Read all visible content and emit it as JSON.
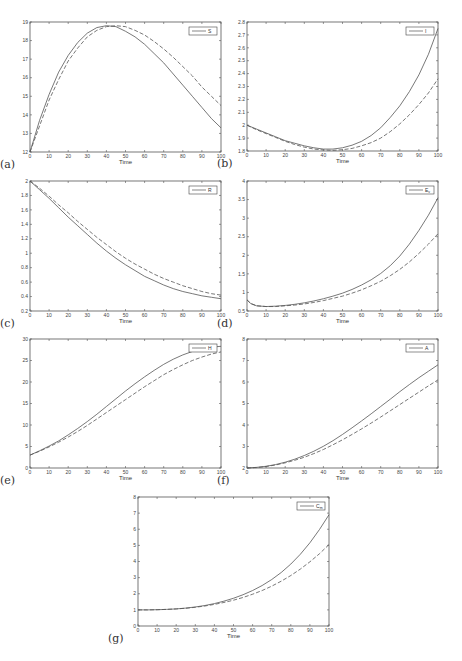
{
  "figure": {
    "panels": [
      {
        "id": "a",
        "label": "(a)",
        "legend": "S",
        "legend_sub": "",
        "xlabel": "Time"
      },
      {
        "id": "b",
        "label": "(b)",
        "legend": "I",
        "legend_sub": "",
        "xlabel": "Time"
      },
      {
        "id": "c",
        "label": "(c)",
        "legend": "R",
        "legend_sub": "",
        "xlabel": "Time"
      },
      {
        "id": "d",
        "label": "(d)",
        "legend": "E",
        "legend_sub": "v",
        "xlabel": "Time"
      },
      {
        "id": "e",
        "label": "(e)",
        "legend": "H",
        "legend_sub": "",
        "xlabel": "Time"
      },
      {
        "id": "f",
        "label": "(f)",
        "legend": "A",
        "legend_sub": "",
        "xlabel": "Time"
      },
      {
        "id": "g",
        "label": "(g)",
        "legend": "C",
        "legend_sub": "m",
        "xlabel": "Time"
      }
    ]
  },
  "chart_data": [
    {
      "type": "line",
      "panel": "(a)",
      "title": "",
      "xlabel": "Time",
      "ylabel": "",
      "legend": [
        "S"
      ],
      "legend_position": "upper right",
      "grid": false,
      "xlim": [
        0,
        100
      ],
      "ylim": [
        12,
        19
      ],
      "xticks": [
        0,
        10,
        20,
        30,
        40,
        50,
        60,
        70,
        80,
        90,
        100
      ],
      "yticks": [
        12,
        13,
        14,
        15,
        16,
        17,
        18,
        19
      ],
      "x": [
        0,
        5,
        10,
        15,
        20,
        25,
        30,
        35,
        40,
        45,
        50,
        55,
        60,
        65,
        70,
        75,
        80,
        85,
        90,
        95,
        100
      ],
      "series": [
        {
          "name": "S (solid)",
          "style": "solid",
          "values": [
            12.0,
            13.7,
            15.1,
            16.3,
            17.2,
            17.9,
            18.4,
            18.7,
            18.8,
            18.75,
            18.5,
            18.2,
            17.8,
            17.3,
            16.8,
            16.2,
            15.6,
            15.0,
            14.4,
            13.8,
            13.3
          ]
        },
        {
          "name": "S (dashed)",
          "style": "dashed",
          "values": [
            12.0,
            13.4,
            14.8,
            15.9,
            16.9,
            17.6,
            18.2,
            18.55,
            18.75,
            18.8,
            18.75,
            18.55,
            18.3,
            17.95,
            17.55,
            17.1,
            16.6,
            16.1,
            15.5,
            15.0,
            14.5
          ]
        }
      ]
    },
    {
      "type": "line",
      "panel": "(b)",
      "title": "",
      "xlabel": "Time",
      "ylabel": "",
      "legend": [
        "I"
      ],
      "legend_position": "upper right",
      "grid": false,
      "xlim": [
        0,
        100
      ],
      "ylim": [
        1.8,
        2.8
      ],
      "xticks": [
        0,
        10,
        20,
        30,
        40,
        50,
        60,
        70,
        80,
        90,
        100
      ],
      "yticks": [
        1.8,
        1.9,
        2.0,
        2.1,
        2.2,
        2.3,
        2.4,
        2.5,
        2.6,
        2.7,
        2.8
      ],
      "x": [
        0,
        5,
        10,
        15,
        20,
        25,
        30,
        35,
        40,
        45,
        50,
        55,
        60,
        65,
        70,
        75,
        80,
        85,
        90,
        95,
        100
      ],
      "series": [
        {
          "name": "I (solid)",
          "style": "solid",
          "values": [
            2.0,
            1.97,
            1.94,
            1.91,
            1.88,
            1.86,
            1.84,
            1.825,
            1.815,
            1.815,
            1.825,
            1.845,
            1.875,
            1.92,
            1.98,
            2.06,
            2.15,
            2.26,
            2.39,
            2.55,
            2.75
          ]
        },
        {
          "name": "I (dashed)",
          "style": "dashed",
          "values": [
            2.0,
            1.965,
            1.935,
            1.905,
            1.875,
            1.85,
            1.83,
            1.815,
            1.808,
            1.805,
            1.81,
            1.82,
            1.84,
            1.865,
            1.9,
            1.95,
            2.01,
            2.08,
            2.16,
            2.25,
            2.36
          ]
        }
      ]
    },
    {
      "type": "line",
      "panel": "(c)",
      "title": "",
      "xlabel": "Time",
      "ylabel": "",
      "legend": [
        "R"
      ],
      "legend_position": "upper right",
      "grid": false,
      "xlim": [
        0,
        100
      ],
      "ylim": [
        0.2,
        2.0
      ],
      "xticks": [
        0,
        10,
        20,
        30,
        40,
        50,
        60,
        70,
        80,
        90,
        100
      ],
      "yticks": [
        0.2,
        0.4,
        0.6,
        0.8,
        1.0,
        1.2,
        1.4,
        1.6,
        1.8,
        2.0
      ],
      "x": [
        0,
        5,
        10,
        15,
        20,
        25,
        30,
        35,
        40,
        45,
        50,
        55,
        60,
        65,
        70,
        75,
        80,
        85,
        90,
        95,
        100
      ],
      "series": [
        {
          "name": "R (solid)",
          "style": "solid",
          "values": [
            2.0,
            1.88,
            1.76,
            1.63,
            1.5,
            1.38,
            1.26,
            1.14,
            1.03,
            0.93,
            0.84,
            0.76,
            0.68,
            0.62,
            0.56,
            0.51,
            0.47,
            0.44,
            0.41,
            0.39,
            0.37
          ]
        },
        {
          "name": "R (dashed)",
          "style": "dashed",
          "values": [
            2.0,
            1.9,
            1.79,
            1.67,
            1.56,
            1.44,
            1.33,
            1.22,
            1.12,
            1.02,
            0.93,
            0.85,
            0.78,
            0.71,
            0.65,
            0.6,
            0.55,
            0.51,
            0.47,
            0.44,
            0.42
          ]
        }
      ]
    },
    {
      "type": "line",
      "panel": "(d)",
      "title": "",
      "xlabel": "Time",
      "ylabel": "",
      "legend": [
        "E_v"
      ],
      "legend_position": "upper right",
      "grid": false,
      "xlim": [
        0,
        100
      ],
      "ylim": [
        0.5,
        4.0
      ],
      "xticks": [
        0,
        10,
        20,
        30,
        40,
        50,
        60,
        70,
        80,
        90,
        100
      ],
      "yticks": [
        0.5,
        1.0,
        1.5,
        2.0,
        2.5,
        3.0,
        3.5,
        4.0
      ],
      "x": [
        0,
        2,
        5,
        10,
        15,
        20,
        25,
        30,
        35,
        40,
        45,
        50,
        55,
        60,
        65,
        70,
        75,
        80,
        85,
        90,
        95,
        100
      ],
      "series": [
        {
          "name": "E_v (solid)",
          "style": "solid",
          "values": [
            0.8,
            0.7,
            0.64,
            0.62,
            0.63,
            0.65,
            0.68,
            0.72,
            0.77,
            0.83,
            0.9,
            0.98,
            1.08,
            1.2,
            1.34,
            1.51,
            1.72,
            1.98,
            2.3,
            2.67,
            3.08,
            3.55
          ]
        },
        {
          "name": "E_v (dashed)",
          "style": "dashed",
          "values": [
            0.8,
            0.7,
            0.64,
            0.62,
            0.62,
            0.64,
            0.66,
            0.69,
            0.73,
            0.78,
            0.84,
            0.9,
            0.98,
            1.07,
            1.18,
            1.3,
            1.45,
            1.62,
            1.82,
            2.05,
            2.3,
            2.58
          ]
        }
      ]
    },
    {
      "type": "line",
      "panel": "(e)",
      "title": "",
      "xlabel": "Time",
      "ylabel": "",
      "legend": [
        "H"
      ],
      "legend_position": "upper right",
      "grid": false,
      "xlim": [
        0,
        100
      ],
      "ylim": [
        0,
        30
      ],
      "xticks": [
        0,
        10,
        20,
        30,
        40,
        50,
        60,
        70,
        80,
        90,
        100
      ],
      "yticks": [
        0,
        5,
        10,
        15,
        20,
        25,
        30
      ],
      "x": [
        0,
        5,
        10,
        15,
        20,
        25,
        30,
        35,
        40,
        45,
        50,
        55,
        60,
        65,
        70,
        75,
        80,
        85,
        90,
        95,
        100
      ],
      "series": [
        {
          "name": "H (solid)",
          "style": "solid",
          "values": [
            3.0,
            4.0,
            5.1,
            6.3,
            7.7,
            9.2,
            10.8,
            12.5,
            14.3,
            16.1,
            17.9,
            19.6,
            21.2,
            22.7,
            24.1,
            25.3,
            26.3,
            27.1,
            27.7,
            28.1,
            28.3
          ]
        },
        {
          "name": "H (dashed)",
          "style": "dashed",
          "values": [
            3.0,
            3.9,
            4.9,
            6.0,
            7.2,
            8.5,
            9.9,
            11.4,
            12.9,
            14.4,
            15.9,
            17.4,
            18.9,
            20.3,
            21.7,
            22.9,
            24.0,
            25.0,
            25.8,
            26.5,
            27.0
          ]
        }
      ]
    },
    {
      "type": "line",
      "panel": "(f)",
      "title": "",
      "xlabel": "Time",
      "ylabel": "",
      "legend": [
        "A"
      ],
      "legend_position": "upper right",
      "grid": false,
      "xlim": [
        0,
        100
      ],
      "ylim": [
        2,
        8
      ],
      "xticks": [
        0,
        10,
        20,
        30,
        40,
        50,
        60,
        70,
        80,
        90,
        100
      ],
      "yticks": [
        2,
        3,
        4,
        5,
        6,
        7,
        8
      ],
      "x": [
        0,
        5,
        10,
        15,
        20,
        25,
        30,
        35,
        40,
        45,
        50,
        55,
        60,
        65,
        70,
        75,
        80,
        85,
        90,
        95,
        100
      ],
      "series": [
        {
          "name": "A (solid)",
          "style": "solid",
          "values": [
            2.0,
            2.03,
            2.08,
            2.16,
            2.27,
            2.41,
            2.58,
            2.78,
            3.01,
            3.27,
            3.56,
            3.87,
            4.19,
            4.52,
            4.86,
            5.2,
            5.55,
            5.88,
            6.2,
            6.5,
            6.8
          ]
        },
        {
          "name": "A (dashed)",
          "style": "dashed",
          "values": [
            2.0,
            2.02,
            2.07,
            2.14,
            2.24,
            2.36,
            2.5,
            2.67,
            2.86,
            3.08,
            3.31,
            3.56,
            3.82,
            4.09,
            4.37,
            4.66,
            4.95,
            5.24,
            5.53,
            5.82,
            6.1
          ]
        }
      ]
    },
    {
      "type": "line",
      "panel": "(g)",
      "title": "",
      "xlabel": "Time",
      "ylabel": "",
      "legend": [
        "C_m"
      ],
      "legend_position": "upper right",
      "grid": false,
      "xlim": [
        0,
        100
      ],
      "ylim": [
        0,
        8
      ],
      "xticks": [
        0,
        10,
        20,
        30,
        40,
        50,
        60,
        70,
        80,
        90,
        100
      ],
      "yticks": [
        0,
        1,
        2,
        3,
        4,
        5,
        6,
        7,
        8
      ],
      "x": [
        0,
        5,
        10,
        15,
        20,
        25,
        30,
        35,
        40,
        45,
        50,
        55,
        60,
        65,
        70,
        75,
        80,
        85,
        90,
        95,
        100
      ],
      "series": [
        {
          "name": "C_m (solid)",
          "style": "solid",
          "values": [
            1.0,
            1.0,
            1.01,
            1.03,
            1.06,
            1.11,
            1.18,
            1.27,
            1.39,
            1.54,
            1.72,
            1.94,
            2.2,
            2.51,
            2.88,
            3.32,
            3.84,
            4.45,
            5.16,
            5.98,
            6.9
          ]
        },
        {
          "name": "C_m (dashed)",
          "style": "dashed",
          "values": [
            1.0,
            1.0,
            1.01,
            1.03,
            1.06,
            1.1,
            1.16,
            1.24,
            1.34,
            1.46,
            1.6,
            1.77,
            1.97,
            2.2,
            2.47,
            2.78,
            3.13,
            3.53,
            3.98,
            4.48,
            5.05
          ]
        }
      ]
    }
  ]
}
